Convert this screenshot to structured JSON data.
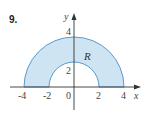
{
  "problem_number": "9.",
  "region_label": "R",
  "axes": {
    "x_label": "x",
    "y_label": "y",
    "x_ticks": [
      "-4",
      "-2",
      "0",
      "2",
      "4"
    ],
    "y_ticks": [
      "2",
      "4"
    ]
  },
  "region": {
    "shape": "upper half annulus",
    "inner_radius": 2,
    "outer_radius": 4
  },
  "colors": {
    "fill": "#cfe4f3",
    "stroke": "#5b9bd0",
    "axis": "#333333",
    "text": "#444444"
  }
}
